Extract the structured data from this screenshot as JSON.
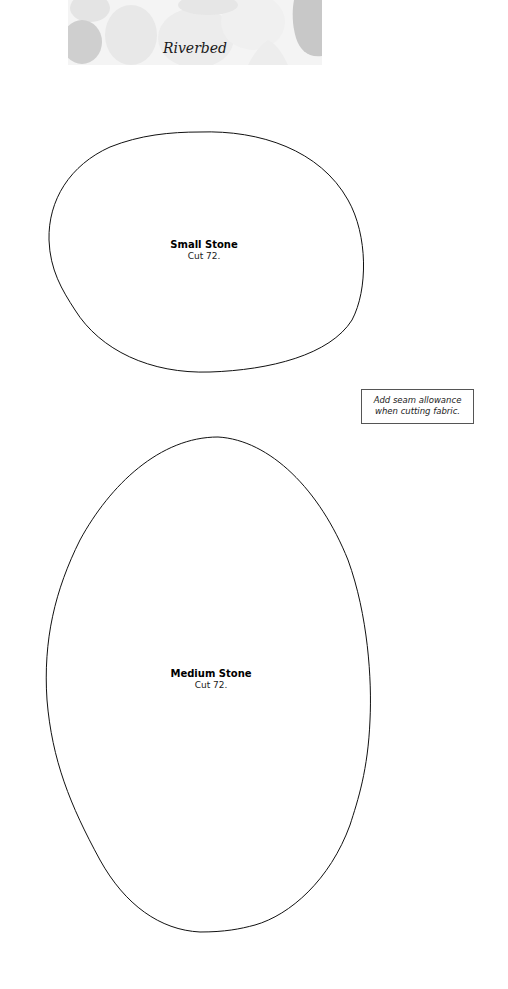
{
  "header": {
    "title": "Riverbed"
  },
  "templates": [
    {
      "name": "Small Stone",
      "instruction": "Cut 72."
    },
    {
      "name": "Medium Stone",
      "instruction": "Cut 72."
    }
  ],
  "note": {
    "line1": "Add seam allowance",
    "line2": "when cutting fabric."
  },
  "colors": {
    "outline": "#000000",
    "banner_bg": "#f3f3f3",
    "stone_gray": "#c8c8c8"
  }
}
